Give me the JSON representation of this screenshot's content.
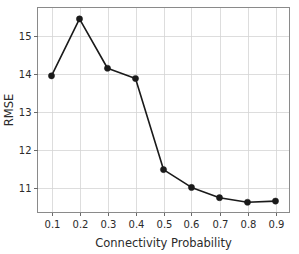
{
  "chart_data": {
    "type": "line",
    "title": "",
    "xlabel": "Connectivity Probability",
    "ylabel": "RMSE",
    "x": [
      0.1,
      0.2,
      0.3,
      0.4,
      0.5,
      0.6,
      0.7,
      0.8,
      0.9
    ],
    "values": [
      13.95,
      15.45,
      14.15,
      13.88,
      11.48,
      11.01,
      10.74,
      10.62,
      10.65
    ],
    "series": [
      {
        "name": "RMSE",
        "values": [
          13.95,
          15.45,
          14.15,
          13.88,
          11.48,
          11.01,
          10.74,
          10.62,
          10.65
        ]
      }
    ],
    "xtick_labels": [
      "0.1",
      "0.2",
      "0.3",
      "0.4",
      "0.5",
      "0.6",
      "0.7",
      "0.8",
      "0.9"
    ],
    "ytick_labels": [
      "11",
      "12",
      "13",
      "14",
      "15"
    ],
    "ytick_values": [
      11,
      12,
      13,
      14,
      15
    ],
    "xlim": [
      0.05,
      0.95
    ],
    "ylim": [
      10.35,
      15.75
    ],
    "grid": true,
    "legend": "none",
    "marker": "circle",
    "line_color": "#1a1a1a",
    "marker_color": "#1a1a1a",
    "grid_color": "#d4d4d4",
    "background_color": "#ffffff"
  }
}
